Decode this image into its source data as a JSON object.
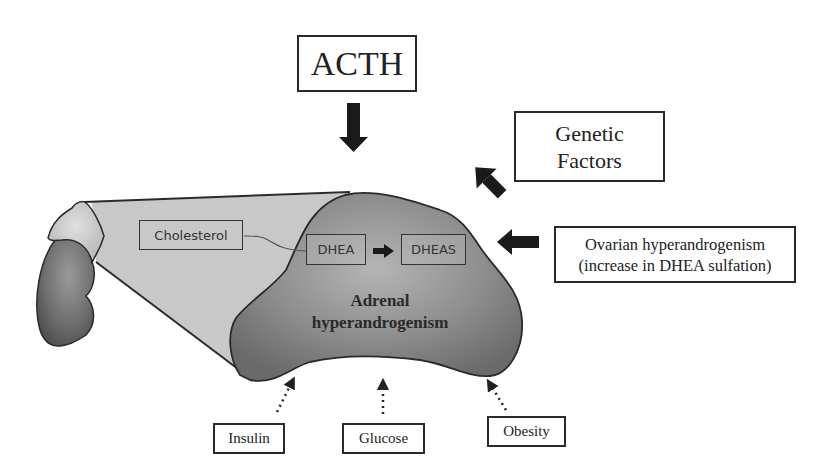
{
  "diagram": {
    "title_box": {
      "label": "ACTH"
    },
    "factors": {
      "genetic": {
        "line1": "Genetic",
        "line2": "Factors"
      },
      "ovarian": {
        "line1": "Ovarian hyperandrogenism",
        "line2": "(increase in DHEA sulfation)"
      },
      "insulin": {
        "label": "Insulin"
      },
      "glucose": {
        "label": "Glucose"
      },
      "obesity": {
        "label": "Obesity"
      }
    },
    "gland": {
      "cholesterol": {
        "label": "Cholesterol"
      },
      "dhea": {
        "label": "DHEA"
      },
      "dheas": {
        "label": "DHEAS"
      },
      "center_label": {
        "line1": "Adrenal",
        "line2": "hyperandrogenism"
      }
    },
    "arrows": {
      "acth_to_gland": "solid",
      "genetic_to_gland": "solid",
      "ovarian_to_gland": "solid",
      "dhea_to_dheas": "solid",
      "insulin_to_gland": "dotted",
      "glucose_to_gland": "dotted",
      "obesity_to_gland": "dotted"
    },
    "colors": {
      "outline": "#2a2a2a",
      "gland_fill": "#8a8a8a",
      "zoom_fill": "#c4c4c4",
      "kidney_fill": "#6e6e6e"
    }
  }
}
